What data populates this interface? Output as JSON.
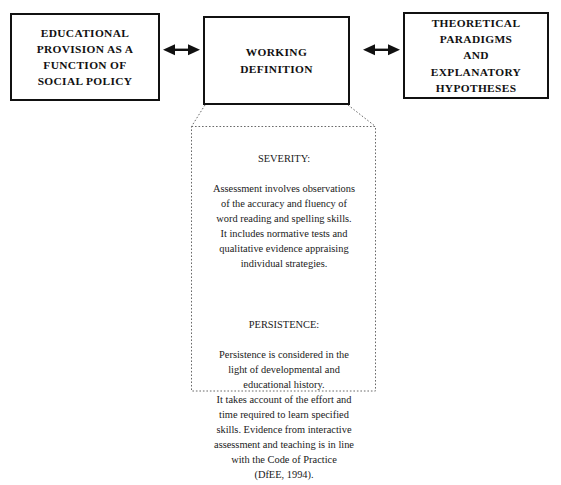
{
  "diagram": {
    "background_color": "#ffffff",
    "line_color": "#111111",
    "boxes": [
      {
        "id": "educational-provision",
        "label": "EDUCATIONAL\nPROVISION AS A\nFUNCTION OF\nSOCIAL POLICY",
        "style": "solid"
      },
      {
        "id": "working-definition",
        "label": "WORKING\nDEFINITION",
        "style": "solid"
      },
      {
        "id": "theoretical-paradigms",
        "label": "THEORETICAL\nPARADIGMS\nAND\nEXPLANATORY\nHYPOTHESES",
        "style": "solid"
      }
    ],
    "connectors": [
      {
        "id": "left-connector",
        "type": "double-headed-arrow",
        "from": "educational-provision",
        "to": "working-definition"
      },
      {
        "id": "right-connector",
        "type": "double-headed-arrow",
        "from": "working-definition",
        "to": "theoretical-paradigms"
      },
      {
        "id": "callout-leader",
        "type": "dotted-callout-shoulders",
        "from": "working-definition",
        "to": "working-definition-callout"
      }
    ],
    "callout": {
      "id": "working-definition-callout",
      "style": "dotted",
      "sections": [
        {
          "heading": "SEVERITY:",
          "body": "Assessment involves observations\nof the accuracy and fluency of\nword reading and spelling skills.\nIt includes normative tests and\nqualitative evidence appraising\nindividual strategies."
        },
        {
          "heading": "PERSISTENCE:",
          "body": "Persistence is considered in the\nlight of developmental and\neducational history.\nIt takes account of the effort and\ntime required to learn specified\nskills. Evidence from interactive\nassessment and teaching is in line\nwith the Code of Practice\n(DfEE, 1994)."
        }
      ]
    }
  }
}
